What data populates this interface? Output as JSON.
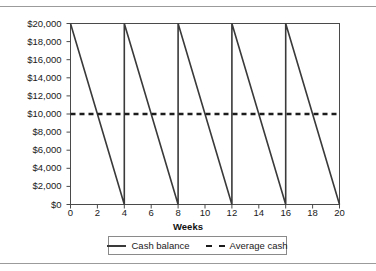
{
  "chart_data": {
    "type": "line",
    "title": "",
    "xlabel": "Weeks",
    "ylabel": "",
    "xlim": [
      0,
      20
    ],
    "ylim": [
      0,
      20000
    ],
    "grid": false,
    "legend_position": "bottom",
    "x_ticks": [
      "0",
      "2",
      "4",
      "6",
      "8",
      "10",
      "12",
      "14",
      "16",
      "18",
      "20"
    ],
    "x_tick_values": [
      0,
      2,
      4,
      6,
      8,
      10,
      12,
      14,
      16,
      18,
      20
    ],
    "y_ticks": [
      "$0",
      "$2,000",
      "$4,000",
      "$6,000",
      "$8,000",
      "$10,000",
      "$12,000",
      "$14,000",
      "$16,000",
      "$18,000",
      "$20,000"
    ],
    "y_tick_values": [
      0,
      2000,
      4000,
      6000,
      8000,
      10000,
      12000,
      14000,
      16000,
      18000,
      20000
    ],
    "series": [
      {
        "name": "Cash balance",
        "style": "solid",
        "color": "#3a3a3a",
        "points": [
          [
            0,
            20000
          ],
          [
            4,
            0
          ],
          [
            4,
            20000
          ],
          [
            8,
            0
          ],
          [
            8,
            20000
          ],
          [
            12,
            0
          ],
          [
            12,
            20000
          ],
          [
            16,
            0
          ],
          [
            16,
            20000
          ],
          [
            20,
            0
          ]
        ]
      },
      {
        "name": "Average cash",
        "style": "dashed",
        "color": "#1c1c1c",
        "points": [
          [
            0,
            10000
          ],
          [
            20,
            10000
          ]
        ]
      }
    ]
  },
  "legend": {
    "entries": [
      {
        "label": "Cash balance",
        "style": "solid"
      },
      {
        "label": "Average cash",
        "style": "dashed"
      }
    ]
  },
  "axis": {
    "x_title": "Weeks"
  },
  "colors": {
    "axis": "#4a4a4a",
    "series_solid": "#3a3a3a",
    "series_dashed": "#1c1c1c",
    "rule": "#9b9b9b",
    "text": "#1a1a1a"
  }
}
